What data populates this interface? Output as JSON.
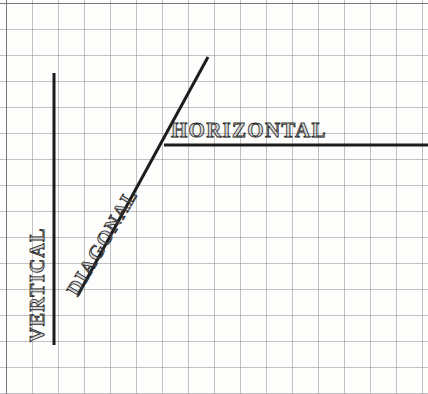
{
  "figure": {
    "background_color": "#fdfdfc",
    "grid": {
      "cell_size": 26,
      "origin_x": 6,
      "origin_y": 3,
      "columns": 17,
      "rows": 16,
      "line_color": "#8d8d93",
      "line_width": 0.7,
      "border_color": "#6f6f76"
    },
    "stroke_color": "#1c1c1c",
    "stroke_width": 3.0
  },
  "labels": {
    "horizontal": "HORIZONTAL",
    "vertical": "VERTICAL",
    "diagonal": "DIAGONAL"
  },
  "chart_data": {
    "type": "line",
    "title": "",
    "xlabel": "",
    "ylabel": "",
    "grid": true,
    "legend_position": "inline-annotations",
    "axis_note": "pixel coordinates, y increases downward",
    "xlim": [
      0,
      428
    ],
    "ylim": [
      0,
      394
    ],
    "series": [
      {
        "name": "VERTICAL",
        "orientation": "vertical",
        "points": [
          [
            54,
            73
          ],
          [
            54,
            345
          ]
        ],
        "length_px": 272,
        "angle_deg": 90,
        "color": "#1c1c1c",
        "width": 3.0
      },
      {
        "name": "DIAGONAL",
        "orientation": "diagonal",
        "points": [
          [
            78,
            295
          ],
          [
            208,
            57
          ]
        ],
        "length_px": 271,
        "angle_deg": -61.4,
        "slope": -1.83,
        "color": "#1c1c1c",
        "width": 3.0
      },
      {
        "name": "HORIZONTAL",
        "orientation": "horizontal",
        "points": [
          [
            164,
            145
          ],
          [
            428,
            145
          ]
        ],
        "length_px": 264,
        "angle_deg": 0,
        "color": "#1c1c1c",
        "width": 3.0
      }
    ],
    "annotations": [
      {
        "text": "VERTICAL",
        "x": 36,
        "y": 282,
        "rotation_deg": -90
      },
      {
        "text": "DIAGONAL",
        "x": 94,
        "y": 232,
        "rotation_deg": -59.5
      },
      {
        "text": "HORIZONTAL",
        "x": 252,
        "y": 131,
        "rotation_deg": 0
      }
    ]
  }
}
